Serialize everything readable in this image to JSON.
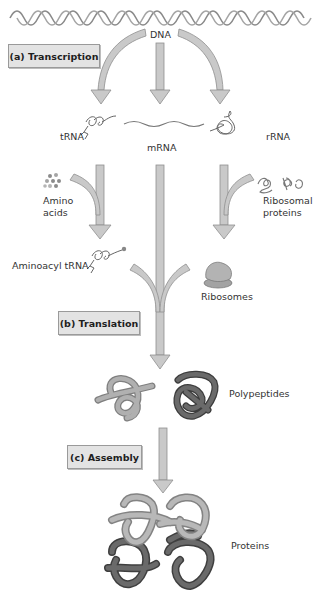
{
  "diagram": {
    "type": "process-flow",
    "stages": [
      {
        "id": "a",
        "label": "(a) Transcription"
      },
      {
        "id": "b",
        "label": "(b) Translation"
      },
      {
        "id": "c",
        "label": "(c) Assembly"
      }
    ],
    "nodes": {
      "dna": "DNA",
      "trna": "tRNA",
      "mrna": "mRNA",
      "rrna": "rRNA",
      "amino_acids_line1": "Amino",
      "amino_acids_line2": "acids",
      "ribosomal_proteins_line1": "Ribosomal",
      "ribosomal_proteins_line2": "proteins",
      "aminoacyl_trna": "Aminoacyl tRNA",
      "ribosomes": "Ribosomes",
      "polypeptides": "Polypeptides",
      "proteins": "Proteins"
    },
    "edges": [
      {
        "from": "DNA",
        "to": "tRNA"
      },
      {
        "from": "DNA",
        "to": "mRNA"
      },
      {
        "from": "DNA",
        "to": "rRNA"
      },
      {
        "from": "tRNA + Amino acids",
        "to": "Aminoacyl tRNA"
      },
      {
        "from": "rRNA + Ribosomal proteins",
        "to": "Ribosomes"
      },
      {
        "from": "Aminoacyl tRNA + mRNA + Ribosomes",
        "to": "Polypeptides"
      },
      {
        "from": "Polypeptides",
        "to": "Proteins"
      }
    ],
    "colors": {
      "arrow_fill": "#c9c9c9",
      "arrow_stroke": "#8f8f8f",
      "label_box": "#e3e3e3",
      "polypeptide_light": "#a9a9a9",
      "polypeptide_dark": "#5a5a5a"
    }
  }
}
